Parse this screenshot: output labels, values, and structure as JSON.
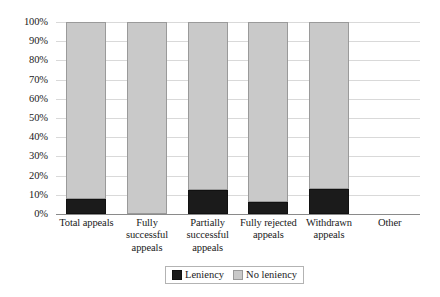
{
  "chart_data": {
    "type": "bar",
    "subtype": "stacked-percent",
    "title": "",
    "xlabel": "",
    "ylabel": "",
    "ylim": [
      0,
      100
    ],
    "ytick_labels": [
      "100%",
      "90%",
      "80%",
      "70%",
      "60%",
      "50%",
      "40%",
      "30%",
      "20%",
      "10%",
      "0%"
    ],
    "ytick_values": [
      100,
      90,
      80,
      70,
      60,
      50,
      40,
      30,
      20,
      10,
      0
    ],
    "grid": true,
    "legend_position": "bottom-center",
    "categories": [
      "Total appeals",
      "Fully successful appeals",
      "Partially successful appeals",
      "Fully rejected appeals",
      "Withdrawn appeals",
      "Other"
    ],
    "category_label_lines": [
      [
        "Total appeals"
      ],
      [
        "Fully",
        "successful",
        "appeals"
      ],
      [
        "Partially",
        "successful",
        "appeals"
      ],
      [
        "Fully rejected",
        "appeals"
      ],
      [
        "Withdrawn",
        "appeals"
      ],
      [
        "Other"
      ]
    ],
    "series": [
      {
        "name": "Leniency",
        "color": "#1b1b1b",
        "values": [
          8,
          0,
          12.5,
          6,
          13,
          null
        ]
      },
      {
        "name": "No leniency",
        "color": "#c9c9c9",
        "values": [
          92,
          100,
          87.5,
          94,
          87,
          null
        ]
      }
    ],
    "legend": [
      {
        "label": "Leniency",
        "color": "#1b1b1b"
      },
      {
        "label": "No leniency",
        "color": "#c9c9c9"
      }
    ]
  }
}
